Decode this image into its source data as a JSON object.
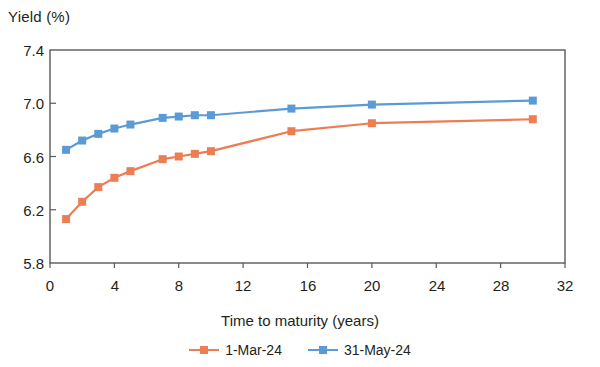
{
  "chart_data": {
    "type": "line",
    "title": "",
    "ylabel": "Yield (%)",
    "xlabel": "Time to maturity (years)",
    "xlim": [
      0,
      32
    ],
    "ylim": [
      5.8,
      7.4
    ],
    "xticks": [
      0,
      4,
      8,
      12,
      16,
      20,
      24,
      28,
      32
    ],
    "yticks": [
      "5.8",
      "6.2",
      "6.6",
      "7.0",
      "7.4"
    ],
    "grid": false,
    "legend_position": "bottom-center",
    "series": [
      {
        "name": "1-Mar-24",
        "color": "#ED7D52",
        "x": [
          1,
          2,
          3,
          4,
          5,
          7,
          8,
          9,
          10,
          15,
          20,
          30
        ],
        "values": [
          6.13,
          6.26,
          6.37,
          6.44,
          6.49,
          6.58,
          6.6,
          6.62,
          6.64,
          6.79,
          6.85,
          6.88
        ]
      },
      {
        "name": "31-May-24",
        "color": "#5B9BD5",
        "x": [
          1,
          2,
          3,
          4,
          5,
          7,
          8,
          9,
          10,
          15,
          20,
          30
        ],
        "values": [
          6.65,
          6.72,
          6.77,
          6.81,
          6.84,
          6.89,
          6.9,
          6.91,
          6.91,
          6.96,
          6.99,
          7.02
        ]
      }
    ]
  },
  "axis": {
    "ylabel_text": "Yield (%)",
    "xlabel_text": "Time to maturity (years)"
  },
  "legend": {
    "items": [
      {
        "label": "1-Mar-24"
      },
      {
        "label": "31-May-24"
      }
    ]
  },
  "colors": {
    "series_1": "#ED7D52",
    "series_2": "#5B9BD5",
    "axis": "#58595b",
    "text": "#231f20"
  }
}
